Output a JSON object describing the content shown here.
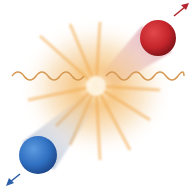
{
  "figure": {
    "particles": [
      {
        "name": "red-particle",
        "color": "#c8262c",
        "cx": 158,
        "cy": 38,
        "r": 18,
        "direction": "up-right"
      },
      {
        "name": "blue-particle",
        "color": "#2f6fc0",
        "cx": 38,
        "cy": 155,
        "r": 19,
        "direction": "down-left"
      }
    ],
    "photons": [
      {
        "name": "photon-left",
        "x1": 12,
        "x2": 86,
        "y": 73,
        "color": "#d9a15a"
      },
      {
        "name": "photon-right",
        "x1": 106,
        "x2": 184,
        "y": 73,
        "color": "#d9a15a"
      }
    ],
    "burst": {
      "cx": 96,
      "cy": 86,
      "color": "#f2b766"
    },
    "colors": {
      "red_arrow": "#b3262e",
      "blue_arrow": "#2a5ea8"
    }
  },
  "caption": {
    "text": ""
  }
}
